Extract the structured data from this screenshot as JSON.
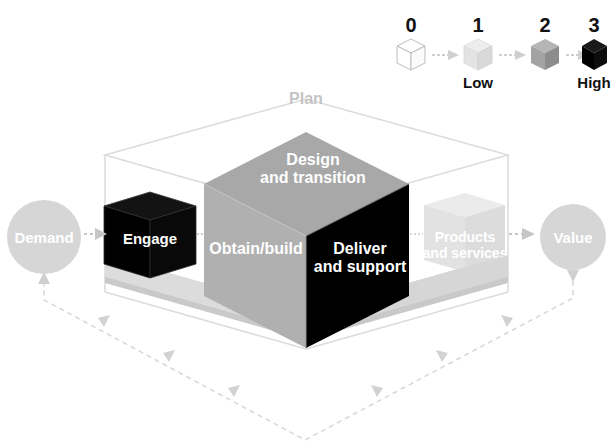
{
  "diagram": {
    "outer_box_label": "Plan",
    "base_label": "Improve",
    "input_node": "Demand",
    "output_node": "Value",
    "cubes": {
      "engage": "Engage",
      "design_line1": "Design",
      "design_line2": "and transition",
      "obtain": "Obtain/build",
      "deliver_line1": "Deliver",
      "deliver_line2": "and support",
      "products_line1": "Products",
      "products_line2": "and services"
    },
    "colors": {
      "black": "#000000",
      "mid_gray": "#9e9e9e",
      "light_gray": "#c9c9c9",
      "pale_gray": "#e3e3e3",
      "very_pale": "#f0f0f0",
      "outline": "#d4d4d4",
      "white": "#ffffff",
      "text_dark": "#111111",
      "node_fill": "#d6d6d6"
    }
  },
  "legend": {
    "name": "value-scale-legend",
    "items": [
      {
        "number": "0",
        "caption": "",
        "shade": "white"
      },
      {
        "number": "1",
        "caption": "Low",
        "shade": "very_light"
      },
      {
        "number": "2",
        "caption": "",
        "shade": "mid"
      },
      {
        "number": "3",
        "caption": "High",
        "shade": "black"
      }
    ]
  }
}
